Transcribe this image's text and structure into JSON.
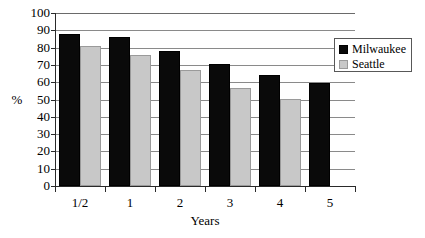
{
  "chart_data": {
    "type": "bar",
    "title": "",
    "subtitle": "",
    "xlabel": "Years",
    "ylabel": "%",
    "categories": [
      "1/2",
      "1",
      "2",
      "3",
      "4",
      "5"
    ],
    "series": [
      {
        "name": "Milwaukee",
        "color": "#000000",
        "values": [
          88,
          86,
          78,
          70.5,
          64,
          59.5
        ]
      },
      {
        "name": "Seattle",
        "color": "#c8c8c8",
        "values": [
          81,
          76,
          67,
          56.5,
          50.5,
          null
        ]
      }
    ],
    "ylim": [
      0,
      100
    ],
    "yticks": [
      0,
      10,
      20,
      30,
      40,
      50,
      60,
      70,
      80,
      90,
      100
    ],
    "ytick_labels": [
      "0",
      "10",
      "20",
      "30",
      "40",
      "50",
      "60",
      "70",
      "80",
      "90",
      "100"
    ],
    "grid": true,
    "grid_axis": "y",
    "legend_position": "upper right",
    "legend_entries": [
      "Milwaukee",
      "Seattle"
    ]
  },
  "axes": {
    "y_title": "%",
    "x_title": "Years"
  },
  "legend": {
    "items": [
      {
        "label": "Milwaukee"
      },
      {
        "label": "Seattle"
      }
    ]
  }
}
